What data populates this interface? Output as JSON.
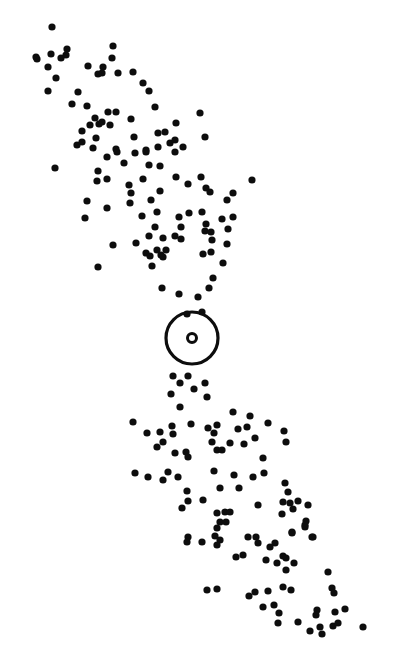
{
  "figure": {
    "title": ""
  },
  "chart_data": {
    "type": "scatter",
    "title": "",
    "xlabel": "",
    "ylabel": "",
    "xlim": [
      0,
      395
    ],
    "ylim": [
      651,
      0
    ],
    "grid": false,
    "legend": "none",
    "colors": {
      "points": "#0d0d0d",
      "target": "#0d0d0d",
      "background": "#ffffff"
    },
    "target": {
      "x": 192,
      "y": 338,
      "label": "central-target"
    },
    "series": [
      {
        "name": "points",
        "points": [
          [
            52,
            27
          ],
          [
            36,
            57
          ],
          [
            37,
            59
          ],
          [
            51,
            54
          ],
          [
            67,
            49
          ],
          [
            66,
            55
          ],
          [
            61,
            58
          ],
          [
            48,
            67
          ],
          [
            56,
            78
          ],
          [
            48,
            91
          ],
          [
            78,
            92
          ],
          [
            113,
            46
          ],
          [
            112,
            58
          ],
          [
            88,
            66
          ],
          [
            103,
            67
          ],
          [
            102,
            73
          ],
          [
            98,
            74
          ],
          [
            118,
            73
          ],
          [
            133,
            72
          ],
          [
            143,
            83
          ],
          [
            149,
            91
          ],
          [
            72,
            104
          ],
          [
            87,
            106
          ],
          [
            155,
            107
          ],
          [
            108,
            112
          ],
          [
            116,
            112
          ],
          [
            200,
            113
          ],
          [
            131,
            119
          ],
          [
            95,
            118
          ],
          [
            99,
            124
          ],
          [
            90,
            125
          ],
          [
            110,
            125
          ],
          [
            102,
            122
          ],
          [
            176,
            123
          ],
          [
            82,
            131
          ],
          [
            77,
            145
          ],
          [
            82,
            142
          ],
          [
            96,
            138
          ],
          [
            93,
            148
          ],
          [
            134,
            137
          ],
          [
            158,
            133
          ],
          [
            165,
            132
          ],
          [
            205,
            137
          ],
          [
            170,
            143
          ],
          [
            175,
            140
          ],
          [
            175,
            152
          ],
          [
            183,
            147
          ],
          [
            158,
            147
          ],
          [
            146,
            150
          ],
          [
            116,
            149
          ],
          [
            135,
            153
          ],
          [
            117,
            152
          ],
          [
            146,
            152
          ],
          [
            107,
            157
          ],
          [
            55,
            168
          ],
          [
            124,
            163
          ],
          [
            149,
            165
          ],
          [
            160,
            166
          ],
          [
            98,
            171
          ],
          [
            97,
            181
          ],
          [
            107,
            179
          ],
          [
            143,
            179
          ],
          [
            176,
            177
          ],
          [
            188,
            184
          ],
          [
            201,
            177
          ],
          [
            252,
            180
          ],
          [
            129,
            185
          ],
          [
            131,
            193
          ],
          [
            130,
            203
          ],
          [
            206,
            188
          ],
          [
            210,
            192
          ],
          [
            160,
            191
          ],
          [
            233,
            193
          ],
          [
            227,
            200
          ],
          [
            87,
            201
          ],
          [
            107,
            208
          ],
          [
            151,
            200
          ],
          [
            85,
            218
          ],
          [
            142,
            216
          ],
          [
            157,
            212
          ],
          [
            179,
            217
          ],
          [
            189,
            213
          ],
          [
            202,
            212
          ],
          [
            222,
            219
          ],
          [
            233,
            217
          ],
          [
            155,
            227
          ],
          [
            181,
            227
          ],
          [
            206,
            224
          ],
          [
            205,
            231
          ],
          [
            211,
            232
          ],
          [
            228,
            229
          ],
          [
            149,
            236
          ],
          [
            175,
            236
          ],
          [
            181,
            239
          ],
          [
            163,
            238
          ],
          [
            212,
            240
          ],
          [
            136,
            243
          ],
          [
            113,
            245
          ],
          [
            227,
            244
          ],
          [
            146,
            253
          ],
          [
            150,
            256
          ],
          [
            157,
            250
          ],
          [
            166,
            250
          ],
          [
            161,
            255
          ],
          [
            152,
            266
          ],
          [
            163,
            257
          ],
          [
            203,
            254
          ],
          [
            211,
            252
          ],
          [
            223,
            263
          ],
          [
            98,
            267
          ],
          [
            213,
            278
          ],
          [
            209,
            288
          ],
          [
            162,
            288
          ],
          [
            179,
            294
          ],
          [
            198,
            297
          ],
          [
            187,
            314
          ],
          [
            202,
            312
          ],
          [
            173,
            376
          ],
          [
            180,
            383
          ],
          [
            188,
            376
          ],
          [
            205,
            383
          ],
          [
            194,
            389
          ],
          [
            171,
            394
          ],
          [
            207,
            397
          ],
          [
            180,
            407
          ],
          [
            233,
            412
          ],
          [
            250,
            416
          ],
          [
            133,
            422
          ],
          [
            268,
            423
          ],
          [
            172,
            426
          ],
          [
            191,
            424
          ],
          [
            160,
            432
          ],
          [
            147,
            433
          ],
          [
            173,
            434
          ],
          [
            208,
            428
          ],
          [
            217,
            425
          ],
          [
            214,
            433
          ],
          [
            238,
            429
          ],
          [
            247,
            427
          ],
          [
            284,
            431
          ],
          [
            286,
            442
          ],
          [
            163,
            442
          ],
          [
            157,
            447
          ],
          [
            212,
            442
          ],
          [
            230,
            443
          ],
          [
            244,
            444
          ],
          [
            255,
            438
          ],
          [
            217,
            450
          ],
          [
            222,
            450
          ],
          [
            175,
            453
          ],
          [
            186,
            452
          ],
          [
            188,
            457
          ],
          [
            263,
            458
          ],
          [
            135,
            473
          ],
          [
            148,
            477
          ],
          [
            168,
            472
          ],
          [
            163,
            480
          ],
          [
            178,
            477
          ],
          [
            214,
            471
          ],
          [
            234,
            475
          ],
          [
            253,
            477
          ],
          [
            264,
            473
          ],
          [
            285,
            483
          ],
          [
            288,
            492
          ],
          [
            187,
            491
          ],
          [
            188,
            501
          ],
          [
            182,
            508
          ],
          [
            220,
            488
          ],
          [
            239,
            488
          ],
          [
            203,
            500
          ],
          [
            258,
            505
          ],
          [
            283,
            502
          ],
          [
            290,
            503
          ],
          [
            298,
            501
          ],
          [
            293,
            509
          ],
          [
            308,
            505
          ],
          [
            282,
            514
          ],
          [
            217,
            513
          ],
          [
            225,
            512
          ],
          [
            230,
            512
          ],
          [
            220,
            522
          ],
          [
            226,
            522
          ],
          [
            217,
            528
          ],
          [
            306,
            521
          ],
          [
            305,
            527
          ],
          [
            292,
            532
          ],
          [
            188,
            537
          ],
          [
            187,
            542
          ],
          [
            202,
            542
          ],
          [
            215,
            536
          ],
          [
            220,
            540
          ],
          [
            217,
            545
          ],
          [
            248,
            537
          ],
          [
            256,
            537
          ],
          [
            258,
            543
          ],
          [
            275,
            543
          ],
          [
            270,
            547
          ],
          [
            312,
            537
          ],
          [
            305,
            525
          ],
          [
            292,
            533
          ],
          [
            313,
            537
          ],
          [
            236,
            557
          ],
          [
            243,
            555
          ],
          [
            266,
            560
          ],
          [
            283,
            556
          ],
          [
            277,
            563
          ],
          [
            286,
            558
          ],
          [
            294,
            563
          ],
          [
            286,
            570
          ],
          [
            328,
            572
          ],
          [
            207,
            590
          ],
          [
            217,
            589
          ],
          [
            249,
            596
          ],
          [
            255,
            592
          ],
          [
            268,
            591
          ],
          [
            283,
            587
          ],
          [
            291,
            590
          ],
          [
            332,
            588
          ],
          [
            334,
            593
          ],
          [
            263,
            607
          ],
          [
            274,
            605
          ],
          [
            279,
            613
          ],
          [
            317,
            610
          ],
          [
            316,
            615
          ],
          [
            335,
            612
          ],
          [
            345,
            609
          ],
          [
            278,
            623
          ],
          [
            298,
            622
          ],
          [
            310,
            631
          ],
          [
            320,
            627
          ],
          [
            322,
            634
          ],
          [
            333,
            626
          ],
          [
            338,
            623
          ],
          [
            363,
            627
          ]
        ]
      }
    ]
  }
}
